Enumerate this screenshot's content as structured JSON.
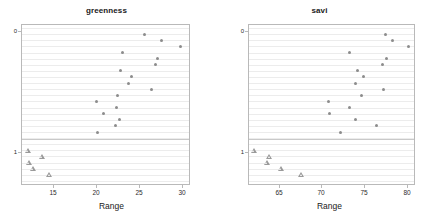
{
  "figure": {
    "background": "#ffffff",
    "marker_color": "#8c8c8c",
    "frame_color": "#b9b9b9",
    "grid_color": "#ececec"
  },
  "chart_data": [
    {
      "type": "scatter",
      "title": "greenness",
      "xlabel": "Range",
      "ylabel": "",
      "xlim": [
        12.0,
        31.6
      ],
      "xticks": [
        15,
        20,
        25,
        30
      ],
      "xticklabels": [
        "15",
        "20",
        "25",
        "30"
      ],
      "yticks": [
        0,
        1
      ],
      "yticklabels": [
        "0",
        "1"
      ],
      "ylim_rows": 26,
      "grid": true,
      "legend": "none",
      "series": [
        {
          "name": "0",
          "marker": "circle",
          "points": [
            {
              "x": 26.4,
              "row": 1
            },
            {
              "x": 28.4,
              "row": 2
            },
            {
              "x": 30.6,
              "row": 3
            },
            {
              "x": 23.8,
              "row": 4
            },
            {
              "x": 27.9,
              "row": 5
            },
            {
              "x": 27.7,
              "row": 6
            },
            {
              "x": 23.6,
              "row": 7
            },
            {
              "x": 24.8,
              "row": 8
            },
            {
              "x": 24.5,
              "row": 9
            },
            {
              "x": 27.2,
              "row": 10
            },
            {
              "x": 23.2,
              "row": 11
            },
            {
              "x": 20.8,
              "row": 12
            },
            {
              "x": 23.1,
              "row": 13
            },
            {
              "x": 21.6,
              "row": 14
            },
            {
              "x": 23.5,
              "row": 15
            },
            {
              "x": 23.0,
              "row": 16
            },
            {
              "x": 20.9,
              "row": 17
            }
          ]
        },
        {
          "name": "1",
          "marker": "triangle",
          "points": [
            {
              "x": 12.7,
              "row": 20
            },
            {
              "x": 14.3,
              "row": 21
            },
            {
              "x": 12.8,
              "row": 22
            },
            {
              "x": 13.3,
              "row": 23
            },
            {
              "x": 15.2,
              "row": 24
            }
          ]
        }
      ]
    },
    {
      "type": "scatter",
      "title": "savi",
      "xlabel": "Range",
      "ylabel": "",
      "xlim": [
        63.0,
        82.6
      ],
      "xticks": [
        65,
        70,
        75,
        80
      ],
      "xticklabels": [
        "65",
        "70",
        "75",
        "80"
      ],
      "yticks": [
        0,
        1
      ],
      "yticklabels": [
        "0",
        "1"
      ],
      "ylim_rows": 26,
      "grid": true,
      "legend": "none",
      "series": [
        {
          "name": "0",
          "marker": "circle",
          "points": [
            {
              "x": 79.2,
              "row": 1
            },
            {
              "x": 80.0,
              "row": 2
            },
            {
              "x": 82.0,
              "row": 3
            },
            {
              "x": 74.9,
              "row": 4
            },
            {
              "x": 79.3,
              "row": 5
            },
            {
              "x": 78.8,
              "row": 6
            },
            {
              "x": 75.9,
              "row": 7
            },
            {
              "x": 76.6,
              "row": 8
            },
            {
              "x": 75.7,
              "row": 9
            },
            {
              "x": 79.0,
              "row": 10
            },
            {
              "x": 76.4,
              "row": 11
            },
            {
              "x": 72.4,
              "row": 12
            },
            {
              "x": 74.9,
              "row": 13
            },
            {
              "x": 72.6,
              "row": 14
            },
            {
              "x": 75.7,
              "row": 15
            },
            {
              "x": 78.1,
              "row": 16
            },
            {
              "x": 73.9,
              "row": 17
            }
          ]
        },
        {
          "name": "1",
          "marker": "triangle",
          "points": [
            {
              "x": 63.6,
              "row": 20
            },
            {
              "x": 65.4,
              "row": 21
            },
            {
              "x": 65.1,
              "row": 22
            },
            {
              "x": 66.8,
              "row": 23
            },
            {
              "x": 69.2,
              "row": 24
            }
          ]
        }
      ]
    }
  ]
}
